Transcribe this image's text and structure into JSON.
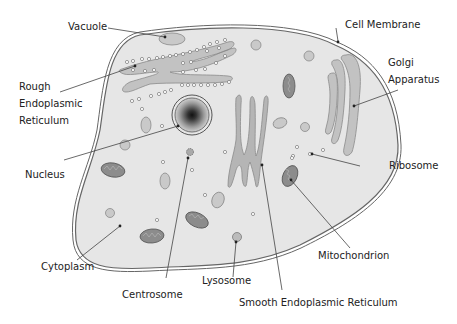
{
  "diagram": {
    "colors": {
      "cytoplasm": "#e6e6e6",
      "membrane": "#666666",
      "organelle": "#c2c2c2",
      "organelle_stroke": "#8a8a8a",
      "mitochondrion": "#8c8c8c",
      "nucleus_dark": "#222222",
      "label_text": "#222222",
      "leader_line": "#444444"
    },
    "labels": {
      "vacuole": "Vacuole",
      "cell_membrane": "Cell Membrane",
      "rough_er_1": "Rough",
      "rough_er_2": "Endoplasmic",
      "rough_er_3": "Reticulum",
      "golgi_1": "Golgi",
      "golgi_2": "Apparatus",
      "nucleus": "Nucleus",
      "ribosome": "Ribosome",
      "cytoplasm": "Cytoplasm",
      "mitochondrion": "Mitochondrion",
      "centrosome": "Centrosome",
      "lysosome": "Lysosome",
      "smooth_er": "Smooth Endoplasmic Reticulum"
    }
  }
}
